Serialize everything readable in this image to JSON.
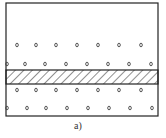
{
  "figure": {
    "caption": "a)",
    "frame": {
      "x": 6,
      "y": 3,
      "w": 152,
      "h": 113
    },
    "band": {
      "y": 70,
      "h": 14,
      "pattern": "diagonal-hatch"
    },
    "particle_rows": [
      {
        "y": 45,
        "xs": [
          17,
          36,
          56,
          77,
          98,
          119,
          141
        ]
      },
      {
        "y": 64,
        "xs": [
          7,
          25,
          45,
          66,
          87,
          108,
          129,
          151
        ]
      },
      {
        "y": 90,
        "xs": [
          17,
          36,
          56,
          77,
          98,
          119,
          141
        ]
      },
      {
        "y": 108,
        "xs": [
          7,
          27,
          46,
          67,
          88,
          109,
          130,
          152
        ]
      }
    ],
    "colors": {
      "line": "#222222",
      "particle": "#444444"
    }
  }
}
